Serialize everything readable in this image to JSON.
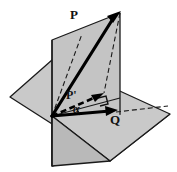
{
  "figure": {
    "background_color": "#ffffff",
    "labels": {
      "vector_p": "P",
      "vector_p_prime": "P'",
      "vector_q": "Q",
      "angle_alpha": "α"
    },
    "colors": {
      "plane_fill": "#c8c8c8",
      "plane_fill_light": "#d4d4d4",
      "plane_edge": "#1a1a1a",
      "vector_stroke": "#000000",
      "dashed_stroke": "#111111",
      "label_color": "#111111"
    },
    "elements": {
      "horizontal_plane": "quadrilateral plane drawn in perspective, light gray fill, black outline",
      "vertical_plane": "quadrilateral plane standing upright, gray fill, black outline, intersecting the horizontal plane",
      "vector_p_arrow": "solid bold arrow from origin up-right to top of vertical plane",
      "vector_p_prime_arrow": "dashed bold arrow from origin up-right, the projection of P",
      "vector_q_arrow": "solid bold arrow from origin to the right along the horizontal plane",
      "right_angle_marker": "small square indicating P' is perpendicular to the plane trace",
      "construction_lines": "dashed parallelogram lines linking P to P' inside the vertical plane"
    },
    "geometry": {
      "origin": [
        52,
        116
      ],
      "p_tip": [
        120,
        13
      ],
      "p_prime_tip": [
        101,
        95
      ],
      "q_tip": [
        116,
        112
      ],
      "angle_alpha_degrees": 35
    }
  }
}
